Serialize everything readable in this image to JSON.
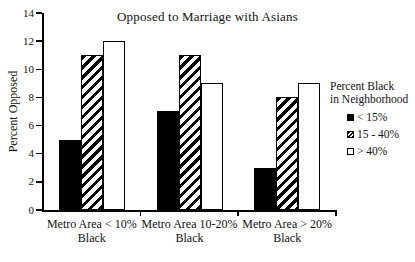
{
  "chart_data": {
    "type": "bar",
    "title": "Opposed to Marriage with Asians",
    "xlabel": "",
    "ylabel": "Percent Opposed",
    "ylim": [
      0,
      14
    ],
    "yticks": [
      0,
      2,
      4,
      6,
      8,
      10,
      12,
      14
    ],
    "grid": false,
    "categories": [
      "Metro Area < 10% Black",
      "Metro Area 10-20% Black",
      "Metro Area > 20% Black"
    ],
    "series": [
      {
        "name": "< 15%",
        "swatch": "solid",
        "values": [
          5,
          7,
          3
        ]
      },
      {
        "name": "15 - 40%",
        "swatch": "hatched",
        "values": [
          11,
          11,
          8
        ]
      },
      {
        "name": "> 40%",
        "swatch": "open",
        "values": [
          12,
          9,
          9
        ]
      }
    ],
    "legend": {
      "title_lines": [
        "Percent Black",
        "in Neighborhood"
      ],
      "position": "right"
    },
    "colors": {
      "bar_fill": "#000000",
      "bar_open": "#ffffff",
      "stroke": "#000000",
      "background": "#ffffff"
    }
  }
}
